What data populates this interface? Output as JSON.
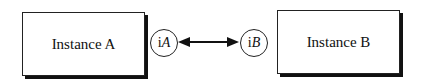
{
  "diagram": {
    "instance_a": {
      "label": "Instance A",
      "port_prefix": "i",
      "port_name": "A"
    },
    "instance_b": {
      "label": "Instance B",
      "port_prefix": "i",
      "port_name": "B"
    },
    "connection": {
      "type": "bidirectional-arrow",
      "from": "iA",
      "to": "iB"
    }
  }
}
